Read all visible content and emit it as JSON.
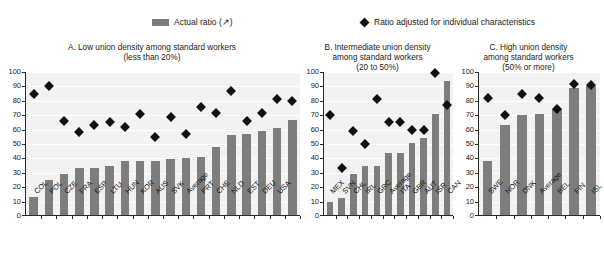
{
  "legend": {
    "bar_label": "Actual ratio (↗)",
    "diamond_label": "Ratio adjusted for individual characteristics",
    "bar_color": "#7d7d7d",
    "diamond_color": "#111111"
  },
  "panels": {
    "a": {
      "title_line1": "A. Low union density among standard workers",
      "title_line2": "(less than 20%)"
    },
    "b": {
      "title_line1": "B. Intermediate union density",
      "title_line2": "among standard workers",
      "title_line3": "(20 to 50%)"
    },
    "c": {
      "title_line1": "C. High union density",
      "title_line2": "among standard workers",
      "title_line3": "(50% or more)"
    }
  },
  "axis": {
    "ticks": [
      100,
      90,
      80,
      70,
      60,
      50,
      40,
      30,
      20,
      10,
      0
    ]
  },
  "chart_data": [
    {
      "type": "bar",
      "id": "panel-a",
      "title": "A. Low union density among standard workers (less than 20%)",
      "xlabel": "",
      "ylabel": "",
      "ylim": [
        0,
        100
      ],
      "grid": true,
      "legend_position": "top",
      "categories": [
        "COL",
        "POL",
        "CZE",
        "FRA",
        "ESP",
        "LTU",
        "HUN",
        "KOR",
        "AUS",
        "SVK",
        "Average",
        "PRT",
        "CHE",
        "NLD",
        "EST",
        "DEU",
        "USA"
      ],
      "series": [
        {
          "name": "Actual ratio (↗)",
          "type": "bar",
          "values": [
            13.5,
            25,
            29.5,
            33,
            33,
            34.5,
            38,
            38,
            38,
            39.5,
            40,
            41,
            48,
            56.5,
            57,
            59,
            61,
            66.5
          ]
        },
        {
          "name": "Ratio adjusted for individual characteristics",
          "type": "scatter",
          "values": [
            85,
            90,
            66,
            58.5,
            63,
            65.5,
            62,
            71,
            55,
            68.5,
            57,
            75.5,
            71.5,
            86.5,
            66,
            71.5,
            81,
            80
          ]
        }
      ]
    },
    {
      "type": "bar",
      "id": "panel-b",
      "title": "B. Intermediate union density among standard workers (20 to 50%)",
      "xlabel": "",
      "ylabel": "",
      "ylim": [
        0,
        100
      ],
      "grid": true,
      "legend_position": "top",
      "categories": [
        "MEX",
        "SVN",
        "CHL",
        "IRL",
        "GRC",
        "Average",
        "ITA",
        "GBR",
        "AUT",
        "ISR",
        "CAN"
      ],
      "series": [
        {
          "name": "Actual ratio (↗)",
          "type": "bar",
          "values": [
            10,
            12.5,
            29,
            35,
            35,
            43.5,
            44,
            51,
            54,
            71,
            94
          ]
        },
        {
          "name": "Ratio adjusted for individual characteristics",
          "type": "scatter",
          "values": [
            70,
            33.5,
            59,
            50,
            81.5,
            65.5,
            65.5,
            60,
            59.5,
            99.5,
            77
          ]
        }
      ]
    },
    {
      "type": "bar",
      "id": "panel-c",
      "title": "C. High union density among standard workers (50% or more)",
      "xlabel": "",
      "ylabel": "",
      "ylim": [
        0,
        100
      ],
      "grid": true,
      "legend_position": "top",
      "categories": [
        "SWE",
        "NOR",
        "DNK",
        "Average",
        "BEL",
        "FIN",
        "ISL"
      ],
      "series": [
        {
          "name": "Actual ratio (↗)",
          "type": "bar",
          "values": [
            38,
            63,
            70,
            70.5,
            74,
            89,
            90
          ]
        },
        {
          "name": "Ratio adjusted for individual characteristics",
          "type": "scatter",
          "values": [
            82,
            70,
            85,
            82,
            74.5,
            92,
            91
          ]
        }
      ]
    }
  ]
}
